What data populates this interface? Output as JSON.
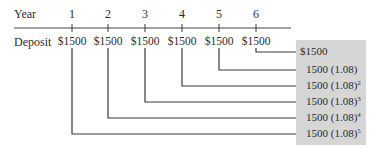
{
  "header": {
    "year_label": "Year",
    "deposit_label": "Deposit"
  },
  "years": [
    "1",
    "2",
    "3",
    "4",
    "5",
    "6"
  ],
  "deposits": [
    "$1500",
    "$1500",
    "$1500",
    "$1500",
    "$1500",
    "$1500"
  ],
  "future_values": [
    {
      "base": "$1500",
      "exp": ""
    },
    {
      "base": "1500 (1.08)",
      "exp": ""
    },
    {
      "base": "1500 (1.08)",
      "exp": "2"
    },
    {
      "base": "1500 (1.08)",
      "exp": "3"
    },
    {
      "base": "1500 (1.08)",
      "exp": "4"
    },
    {
      "base": "1500 (1.08)",
      "exp": "5"
    }
  ],
  "colors": {
    "box_fill": "#d6d6d6",
    "line": "#3a3a3a"
  }
}
